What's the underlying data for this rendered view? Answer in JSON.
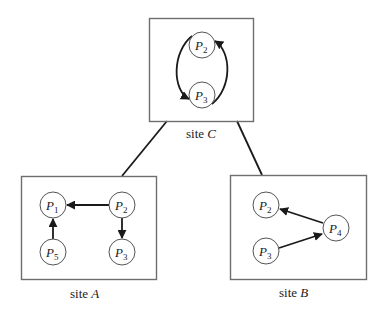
{
  "diagram": {
    "type": "distributed wait-for graph",
    "sites": {
      "C": {
        "label_prefix": "site",
        "label_letter": "C",
        "nodes": [
          {
            "name": "P",
            "sub": "2"
          },
          {
            "name": "P",
            "sub": "3"
          }
        ],
        "edges": [
          {
            "from": "P2",
            "to": "P3"
          },
          {
            "from": "P3",
            "to": "P2"
          }
        ]
      },
      "A": {
        "label_prefix": "site",
        "label_letter": "A",
        "nodes": [
          {
            "name": "P",
            "sub": "1"
          },
          {
            "name": "P",
            "sub": "2"
          },
          {
            "name": "P",
            "sub": "5"
          },
          {
            "name": "P",
            "sub": "3"
          }
        ],
        "edges": [
          {
            "from": "P2",
            "to": "P1"
          },
          {
            "from": "P2",
            "to": "P3"
          },
          {
            "from": "P5",
            "to": "P1"
          }
        ]
      },
      "B": {
        "label_prefix": "site",
        "label_letter": "B",
        "nodes": [
          {
            "name": "P",
            "sub": "2"
          },
          {
            "name": "P",
            "sub": "4"
          },
          {
            "name": "P",
            "sub": "3"
          }
        ],
        "edges": [
          {
            "from": "P4",
            "to": "P2"
          },
          {
            "from": "P3",
            "to": "P4"
          }
        ]
      }
    },
    "links": [
      {
        "from": "site C",
        "to": "site A"
      },
      {
        "from": "site C",
        "to": "site B"
      }
    ]
  }
}
